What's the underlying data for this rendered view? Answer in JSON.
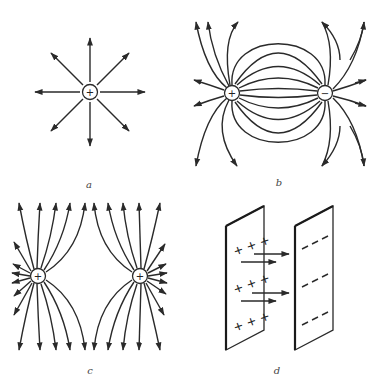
{
  "figure": {
    "panels": [
      {
        "id": "a",
        "label": "a",
        "description": "Single positive point charge with radial field lines",
        "charges": [
          {
            "sign": "+",
            "x": 90,
            "y": 92
          }
        ],
        "field_lines": 8
      },
      {
        "id": "b",
        "label": "b",
        "description": "Electric dipole: positive and negative charges with field lines from + to -",
        "charges": [
          {
            "sign": "+",
            "x": 232,
            "y": 93
          },
          {
            "sign": "−",
            "x": 325,
            "y": 93
          }
        ]
      },
      {
        "id": "c",
        "label": "c",
        "description": "Two like positive charges with repelling field lines",
        "charges": [
          {
            "sign": "+",
            "x": 38,
            "y": 276
          },
          {
            "sign": "+",
            "x": 140,
            "y": 276
          }
        ]
      },
      {
        "id": "d",
        "label": "d",
        "description": "Parallel plate capacitor with positive and negative plates and uniform field arrows",
        "left_plate_marks": [
          "+ + +",
          "+ + +",
          "+ + +"
        ],
        "right_plate_marks": [
          "— — —",
          "— — —",
          "— — —"
        ]
      }
    ]
  }
}
